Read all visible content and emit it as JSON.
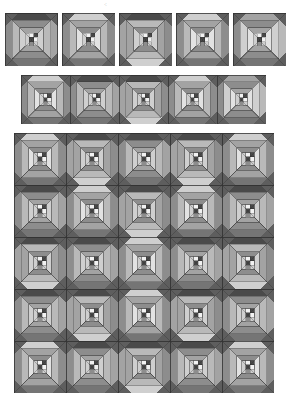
{
  "document": {
    "title": "Pineapple Log Cabin Quilt Block Layout Diagram",
    "background_color": "#ffffff",
    "artifact_mark": "·:"
  },
  "palette": {
    "outline": "#2b2b2b",
    "very_dark": "#4a4a4a",
    "dark": "#5e5e5e",
    "mid_dark": "#757575",
    "mid": "#8d8d8d",
    "mid_light": "#a3a3a3",
    "light": "#b9b9b9",
    "very_light": "#cfcfcf",
    "pale": "#e2e2e2",
    "white": "#f2f2f2"
  },
  "block": {
    "name": "pineapple-log-cabin-block",
    "unit_size": 100,
    "description": "Square block: four corner triangles radiating from center, stacked trapezoid logs on each side, 4-patch checkerboard center"
  },
  "sections": [
    {
      "id": "top-row",
      "name": "single-block-row",
      "label": "Row of five separated blocks",
      "x": 5,
      "y": 13,
      "block_size": 53,
      "gap": 4,
      "rows": 1,
      "cols": 5,
      "separated": true,
      "variants": [
        0,
        1,
        2,
        1,
        3
      ]
    },
    {
      "id": "middle-row",
      "name": "joined-block-row",
      "label": "Row of five joined blocks",
      "x": 21,
      "y": 75,
      "block_size": 49,
      "gap": 0,
      "rows": 1,
      "cols": 5,
      "separated": false,
      "variants": [
        1,
        0,
        2,
        1,
        3
      ]
    },
    {
      "id": "bottom-grid",
      "name": "joined-block-grid",
      "label": "Grid of five by five joined blocks",
      "x": 14,
      "y": 133,
      "block_size": 52,
      "gap": 0,
      "rows": 5,
      "cols": 5,
      "separated": false,
      "variants": [
        [
          1,
          2,
          0,
          2,
          1
        ],
        [
          0,
          1,
          2,
          1,
          0
        ],
        [
          2,
          0,
          1,
          0,
          2
        ],
        [
          0,
          2,
          1,
          2,
          0
        ],
        [
          1,
          0,
          2,
          0,
          1
        ]
      ]
    }
  ],
  "variant_defs": [
    {
      "id": 0,
      "name": "variant-dark-top",
      "top": "very_dark",
      "bottom": "mid_dark",
      "left": "mid",
      "right": "mid_light",
      "corner": "dark",
      "log_outer_v": "light",
      "log_outer_h": "mid",
      "log_inner_v": "very_light",
      "log_inner_h": "mid_light",
      "center_a": "white",
      "center_b": "very_dark"
    },
    {
      "id": 1,
      "name": "variant-light-top",
      "top": "very_light",
      "bottom": "mid_dark",
      "left": "mid",
      "right": "mid",
      "corner": "dark",
      "log_outer_v": "light",
      "log_outer_h": "mid_light",
      "log_inner_v": "pale",
      "log_inner_h": "mid",
      "center_a": "white",
      "center_b": "very_dark"
    },
    {
      "id": 2,
      "name": "variant-light-bottom",
      "top": "very_dark",
      "bottom": "very_light",
      "left": "mid_light",
      "right": "mid",
      "corner": "dark",
      "log_outer_v": "mid_light",
      "log_outer_h": "light",
      "log_inner_v": "very_light",
      "log_inner_h": "mid",
      "center_a": "white",
      "center_b": "very_dark"
    },
    {
      "id": 3,
      "name": "variant-mixed",
      "top": "mid_light",
      "bottom": "mid_dark",
      "left": "mid",
      "right": "light",
      "corner": "dark",
      "log_outer_v": "very_light",
      "log_outer_h": "mid",
      "log_inner_v": "pale",
      "log_inner_h": "mid_light",
      "center_a": "white",
      "center_b": "very_dark"
    }
  ]
}
